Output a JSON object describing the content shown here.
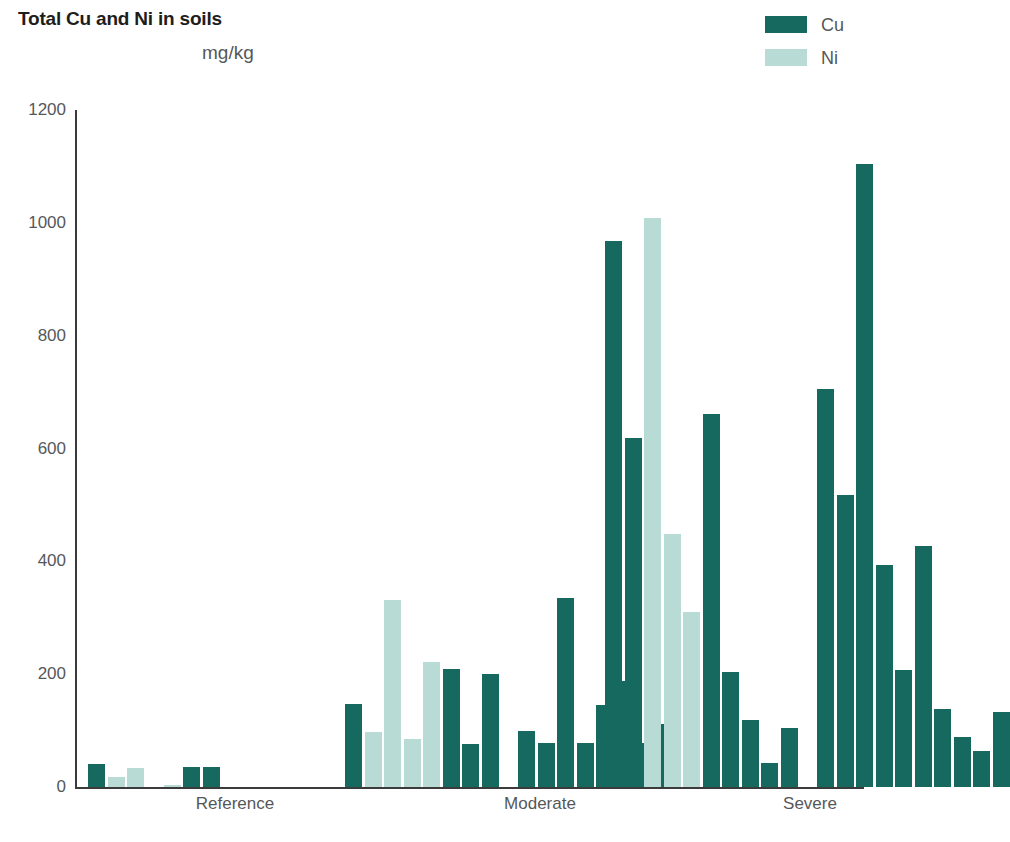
{
  "chart": {
    "title": "Total Cu and Ni in soils",
    "subtitle": "mg/kg"
  },
  "legend": {
    "position": "top-right",
    "entries": [
      {
        "label": "Cu",
        "color": "#15695f",
        "name": "legend-cu"
      },
      {
        "label": "Ni",
        "color": "#b9dbd5",
        "name": "legend-ni"
      }
    ]
  },
  "axes": {
    "y": {
      "min": 0,
      "max": 1200,
      "ticks": [
        0,
        200,
        400,
        600,
        800,
        1000,
        1200
      ],
      "tick_labels": [
        "0",
        "200",
        "400",
        "600",
        "800",
        "1000",
        "1200"
      ]
    },
    "x": {
      "group_labels": [
        "Reference",
        "Moderate",
        "Severe"
      ]
    }
  },
  "chart_data": {
    "type": "bar",
    "title": "Total Cu and Ni in soils",
    "subtitle": "mg/kg",
    "xlabel": "",
    "ylabel": "mg/kg",
    "ylim": [
      0,
      1200
    ],
    "yticks": [
      0,
      200,
      400,
      600,
      800,
      1000,
      1200
    ],
    "grid": false,
    "legend_position": "top-right",
    "categories": [
      "Reference",
      "Moderate",
      "Severe"
    ],
    "series": [
      {
        "name": "Cu",
        "color": "#15695f"
      },
      {
        "name": "Ni",
        "color": "#b9dbd5"
      }
    ],
    "bars": [
      {
        "group": "Reference",
        "cluster": 0,
        "series": "Cu",
        "value": 40
      },
      {
        "group": "Reference",
        "cluster": 0,
        "series": "Ni",
        "value": 18
      },
      {
        "group": "Reference",
        "cluster": 0,
        "series": "Ni",
        "value": 33
      },
      {
        "group": "Reference",
        "cluster": 1,
        "series": "Ni",
        "value": 3
      },
      {
        "group": "Reference",
        "cluster": 1,
        "series": "Cu",
        "value": 35
      },
      {
        "group": "Reference",
        "cluster": 1,
        "series": "Cu",
        "value": 35
      },
      {
        "group": "Moderate",
        "cluster": 0,
        "series": "Cu",
        "value": 148
      },
      {
        "group": "Moderate",
        "cluster": 0,
        "series": "Ni",
        "value": 98
      },
      {
        "group": "Moderate",
        "cluster": 0,
        "series": "Ni",
        "value": 332
      },
      {
        "group": "Moderate",
        "cluster": 0,
        "series": "Ni",
        "value": 85
      },
      {
        "group": "Moderate",
        "cluster": 0,
        "series": "Ni",
        "value": 222
      },
      {
        "group": "Moderate",
        "cluster": 0,
        "series": "Cu",
        "value": 210
      },
      {
        "group": "Moderate",
        "cluster": 0,
        "series": "Cu",
        "value": 76
      },
      {
        "group": "Moderate",
        "cluster": 0,
        "series": "Cu",
        "value": 200
      },
      {
        "group": "Moderate",
        "cluster": 1,
        "series": "Cu",
        "value": 100
      },
      {
        "group": "Moderate",
        "cluster": 1,
        "series": "Cu",
        "value": 78
      },
      {
        "group": "Moderate",
        "cluster": 1,
        "series": "Cu",
        "value": 335
      },
      {
        "group": "Moderate",
        "cluster": 1,
        "series": "Cu",
        "value": 78
      },
      {
        "group": "Moderate",
        "cluster": 1,
        "series": "Cu",
        "value": 145
      },
      {
        "group": "Moderate",
        "cluster": 1,
        "series": "Cu",
        "value": 188
      },
      {
        "group": "Moderate",
        "cluster": 1,
        "series": "Cu",
        "value": 78
      },
      {
        "group": "Moderate",
        "cluster": 1,
        "series": "Cu",
        "value": 112
      },
      {
        "group": "Severe",
        "cluster": 0,
        "series": "Cu",
        "value": 968
      },
      {
        "group": "Severe",
        "cluster": 0,
        "series": "Cu",
        "value": 618
      },
      {
        "group": "Severe",
        "cluster": 0,
        "series": "Ni",
        "value": 1008
      },
      {
        "group": "Severe",
        "cluster": 0,
        "series": "Ni",
        "value": 448
      },
      {
        "group": "Severe",
        "cluster": 0,
        "series": "Ni",
        "value": 310
      },
      {
        "group": "Severe",
        "cluster": 0,
        "series": "Cu",
        "value": 662
      },
      {
        "group": "Severe",
        "cluster": 0,
        "series": "Cu",
        "value": 203
      },
      {
        "group": "Severe",
        "cluster": 0,
        "series": "Cu",
        "value": 118
      },
      {
        "group": "Severe",
        "cluster": 0,
        "series": "Cu",
        "value": 43
      },
      {
        "group": "Severe",
        "cluster": 0,
        "series": "Cu",
        "value": 105
      },
      {
        "group": "Severe",
        "cluster": 1,
        "series": "Cu",
        "value": 705
      },
      {
        "group": "Severe",
        "cluster": 1,
        "series": "Cu",
        "value": 518
      },
      {
        "group": "Severe",
        "cluster": 1,
        "series": "Cu",
        "value": 1105
      },
      {
        "group": "Severe",
        "cluster": 1,
        "series": "Cu",
        "value": 393
      },
      {
        "group": "Severe",
        "cluster": 1,
        "series": "Cu",
        "value": 208
      },
      {
        "group": "Severe",
        "cluster": 1,
        "series": "Cu",
        "value": 428
      },
      {
        "group": "Severe",
        "cluster": 1,
        "series": "Cu",
        "value": 138
      },
      {
        "group": "Severe",
        "cluster": 1,
        "series": "Cu",
        "value": 88
      },
      {
        "group": "Severe",
        "cluster": 1,
        "series": "Cu",
        "value": 63
      },
      {
        "group": "Severe",
        "cluster": 1,
        "series": "Cu",
        "value": 133
      }
    ]
  },
  "layout": {
    "bar_width": 17,
    "bar_gap": 2.5,
    "cluster_gap": 17,
    "group_starts_px": [
      13,
      270,
      530
    ],
    "group_label_centers_px": [
      160,
      465,
      735
    ]
  }
}
